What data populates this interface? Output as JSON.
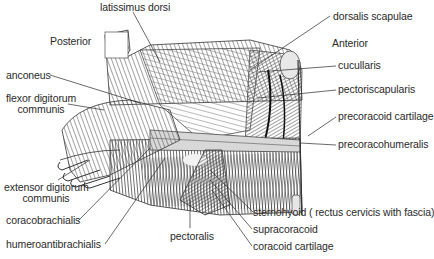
{
  "figure": {
    "orientation": {
      "posterior": "Posterior",
      "anterior": "Anterior"
    },
    "labels": {
      "latissimus_dorsi": "latissimus dorsi",
      "dorsalis_scapulae": "dorsalis scapulae",
      "cucullaris": "cucullaris",
      "pectoriscapularis": "pectoriscapularis",
      "precoracoid_cartilage": "precoracoid cartilage",
      "precoracohumeralis": "precoracohumeralis",
      "anconeus": "anconeus",
      "flexor_digitorum_1": "flexor digitorum",
      "flexor_digitorum_2": "communis",
      "extensor_digitorum_1": "extensor digitorum",
      "extensor_digitorum_2": "communis",
      "coracobrachialis": "coracobrachialis",
      "humeroantibrachialis": "humeroantibrachialis",
      "pectoralis": "pectoralis",
      "sternohyoid": "sternohyoid ( rectus cervicis with fascia)",
      "supracoracoid": "supracoracoid",
      "coracoid_cartilage": "coracoid cartilage"
    },
    "colors": {
      "ink": "#2a2a2a",
      "background": "#ffffff"
    }
  }
}
